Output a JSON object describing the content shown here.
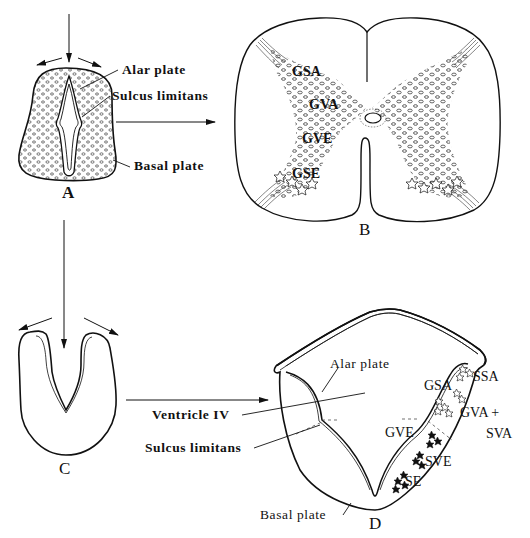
{
  "figure": {
    "panels": {
      "A": {
        "letter": "A",
        "labels": {
          "alar_plate": "Alar plate",
          "sulcus_limitans": "Sulcus limitans",
          "basal_plate": "Basal plate"
        }
      },
      "B": {
        "letter": "B",
        "column_labels": {
          "gsa": "GSA",
          "gva": "GVA",
          "gve": "GVE",
          "gse": "GSE"
        }
      },
      "C": {
        "letter": "C"
      },
      "D": {
        "letter": "D",
        "labels": {
          "alar_plate": "Alar plate",
          "ventricle_iv": "Ventricle IV",
          "sulcus_limitans": "Sulcus limitans",
          "basal_plate": "Basal plate"
        },
        "column_labels": {
          "ssa": "SSA",
          "gsa": "GSA",
          "gva_svа": "GVA +",
          "sva": "SVA",
          "gve": "GVE",
          "sve": "SVE",
          "se": "SE"
        }
      }
    },
    "colors": {
      "ink": "#111111",
      "background": "#ffffff"
    }
  }
}
